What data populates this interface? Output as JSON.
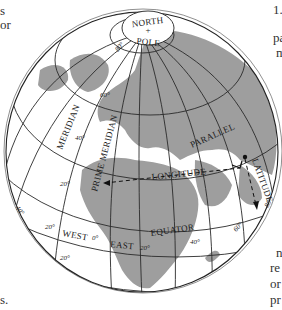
{
  "figure": {
    "colors": {
      "land": "#9e9e9e",
      "ocean": "#ffffff",
      "grid": "#2a2a2a",
      "text": "#1a1a1a"
    },
    "labels": {
      "north_pole_top": "NORTH",
      "north_pole_plus": "+",
      "north_pole_bottom": "POLE",
      "meridian": "MERIDIAN",
      "prime_meridian": "PRIME MERIDIAN",
      "parallel": "PARALLEL",
      "longitude": "LONGITUDE",
      "latitude": "LATITUDE",
      "equator": "EQUATOR",
      "west": "WEST",
      "east": "EAST"
    },
    "degree_labels": {
      "lat_80": "80°",
      "lat_60": "60°",
      "lat_40": "40°",
      "lat_20": "20°",
      "lat_minus_20": "20°",
      "lon_0": "0°",
      "lon_20w": "20°",
      "lon_20e": "20°",
      "lon_40e": "40°",
      "lon_60e": "60°",
      "lon_80e": "80°",
      "lon_40w_edge": "40°"
    }
  },
  "surrounding_text": {
    "left_top_1": "s",
    "left_top_2": "or",
    "left_bottom": "s.",
    "right_top_1": "1.",
    "right_top_2": "pa",
    "right_top_3": "m",
    "right_bottom_1": "n",
    "right_bottom_2": "re",
    "right_bottom_3": "or",
    "right_bottom_4": "pr"
  }
}
